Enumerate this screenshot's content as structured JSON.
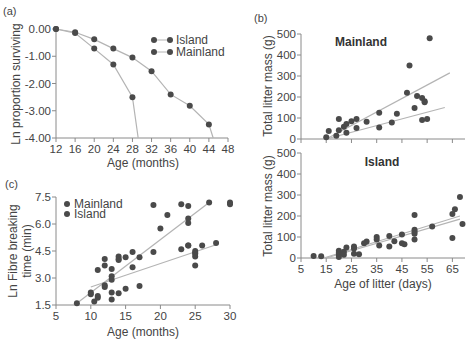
{
  "chart_data": [
    {
      "panel": "(a)",
      "type": "line",
      "title": "",
      "xlabel": "Age (months)",
      "ylabel": "Ln proportion surviving",
      "xlim": [
        12,
        48
      ],
      "ylim": [
        -4.0,
        0.0
      ],
      "xticks": [
        "12",
        "16",
        "20",
        "24",
        "28",
        "32",
        "36",
        "40",
        "44",
        "48"
      ],
      "yticks": [
        "0.00",
        "-1.00",
        "-2.00",
        "-3.00",
        "-4.00"
      ],
      "grid": false,
      "legend": {
        "position": "upper right",
        "entries": [
          "Island",
          "Mainland"
        ]
      },
      "series": [
        {
          "name": "Island",
          "x": [
            12,
            16,
            20,
            24,
            28,
            32,
            36,
            40,
            44,
            44.9
          ],
          "y": [
            0.0,
            -0.12,
            -0.38,
            -0.72,
            -1.05,
            -1.55,
            -2.4,
            -2.82,
            -3.5,
            -4.0
          ],
          "marker_count": 9
        },
        {
          "name": "Mainland",
          "x": [
            12,
            16,
            20,
            24,
            28,
            29.2
          ],
          "y": [
            0.0,
            -0.15,
            -0.72,
            -1.3,
            -2.5,
            -4.0
          ],
          "marker_count": 5
        }
      ]
    },
    {
      "panel": "(b) top",
      "type": "scatter",
      "title": "Mainland",
      "xlabel": "",
      "ylabel": "Total litter mass (g)",
      "xlim": [
        5,
        70
      ],
      "ylim": [
        0,
        500
      ],
      "yticks": [
        "0",
        "100",
        "200",
        "300",
        "400",
        "500"
      ],
      "grid": false,
      "points": {
        "x": [
          15,
          16,
          19,
          20,
          20,
          22,
          23,
          23,
          25,
          27,
          27,
          31,
          36,
          36,
          41,
          43,
          47,
          48,
          50,
          51,
          53,
          53,
          54,
          54,
          55,
          56
        ],
        "y": [
          8,
          38,
          15,
          95,
          42,
          58,
          72,
          30,
          85,
          95,
          52,
          82,
          55,
          125,
          78,
          120,
          220,
          350,
          148,
          205,
          195,
          90,
          180,
          175,
          95,
          480
        ]
      },
      "fit_lines": [
        {
          "x": [
            15,
            64
          ],
          "y": [
            0,
            315
          ]
        },
        {
          "x": [
            15,
            62
          ],
          "y": [
            0,
            150
          ]
        }
      ]
    },
    {
      "panel": "(b) bottom",
      "type": "scatter",
      "title": "Island",
      "xlabel": "Age of litter (days)",
      "ylabel": "Total litter mass (g)",
      "xlim": [
        5,
        70
      ],
      "ylim": [
        0,
        500
      ],
      "xticks": [
        "5",
        "15",
        "25",
        "35",
        "45",
        "55",
        "65"
      ],
      "yticks": [
        "0",
        "100",
        "200",
        "300",
        "400",
        "500"
      ],
      "grid": false,
      "points": {
        "x": [
          10,
          13,
          20,
          20,
          20,
          20,
          22,
          22,
          23,
          26,
          26,
          26,
          28,
          30,
          31,
          35,
          35,
          36,
          40,
          40,
          42,
          45,
          45,
          46,
          50,
          50,
          50,
          50,
          50,
          57,
          65,
          65,
          66,
          68,
          69
        ],
        "y": [
          10,
          8,
          35,
          25,
          15,
          5,
          30,
          15,
          50,
          55,
          45,
          20,
          18,
          70,
          78,
          100,
          88,
          60,
          105,
          55,
          80,
          112,
          70,
          65,
          205,
          135,
          125,
          115,
          88,
          150,
          95,
          210,
          232,
          290,
          162
        ]
      },
      "fit_lines": [
        {
          "x": [
            14,
            68
          ],
          "y": [
            0,
            200
          ]
        },
        {
          "x": [
            15,
            68
          ],
          "y": [
            0,
            185
          ]
        }
      ]
    },
    {
      "panel": "(c)",
      "type": "scatter",
      "title": "",
      "xlabel": "Age (months)",
      "ylabel": "Ln Fibre breaking time (min)",
      "xlim": [
        5,
        30
      ],
      "ylim": [
        1.5,
        7.5
      ],
      "xticks": [
        "5",
        "10",
        "15",
        "20",
        "25",
        "30"
      ],
      "yticks": [
        "7.5",
        "6.0",
        "4.5",
        "3.0",
        "1.5"
      ],
      "grid": false,
      "legend": {
        "position": "upper left",
        "entries": [
          "Mainland",
          "Island"
        ]
      },
      "points": {
        "x": [
          8,
          10,
          10,
          10.5,
          11,
          11,
          11,
          12,
          12,
          12,
          12,
          13,
          13,
          13,
          13,
          13,
          14,
          14,
          14,
          14,
          15,
          15,
          16,
          16,
          17,
          17,
          19,
          19,
          20,
          21,
          23,
          23,
          24,
          24,
          24,
          24,
          24,
          25,
          25,
          25,
          25,
          25,
          26,
          27,
          28,
          30,
          30
        ],
        "y": [
          1.6,
          2.2,
          2.1,
          1.7,
          1.9,
          2.0,
          3.45,
          4.05,
          3.7,
          2.6,
          2.5,
          3.5,
          3.1,
          2.9,
          2.2,
          1.8,
          4.2,
          4.05,
          4.0,
          2.15,
          4.15,
          2.4,
          4.45,
          3.6,
          4.15,
          2.55,
          7.05,
          4.45,
          5.75,
          6.5,
          7.1,
          4.6,
          7.0,
          6.3,
          6.05,
          4.8,
          4.8,
          4.5,
          4.35,
          4.2,
          3.7,
          4.4,
          4.8,
          7.2,
          4.95,
          7.2,
          7.1
        ]
      },
      "fit_lines": [
        {
          "name": "Mainland",
          "x": [
            8,
            27
          ],
          "y": [
            1.6,
            7.2
          ]
        },
        {
          "name": "Island",
          "x": [
            10,
            28
          ],
          "y": [
            2.5,
            4.85
          ]
        }
      ]
    }
  ],
  "labels": {
    "panel_a": "(a)",
    "panel_b": "(b)",
    "panel_c": "(c)",
    "a_ylabel": "Ln proportion surviving",
    "a_xlabel": "Age (months)",
    "a_legend_1": "Island",
    "a_legend_2": "Mainland",
    "b_top_title": "Mainland",
    "b_bottom_title": "Island",
    "b_top_ylabel": "Total litter mass (g)",
    "b_bottom_ylabel": "Total litter mass (g)",
    "b_xlabel": "Age of litter (days)",
    "c_ylabel_1": "Ln Fibre breaking",
    "c_ylabel_2": "time (min)",
    "c_xlabel": "Age (months)",
    "c_legend_1": "Mainland",
    "c_legend_2": "Island"
  },
  "colors": {
    "point": "#4a4a4a",
    "line": "#b4b4b4",
    "axis": "#8a8a8a"
  }
}
